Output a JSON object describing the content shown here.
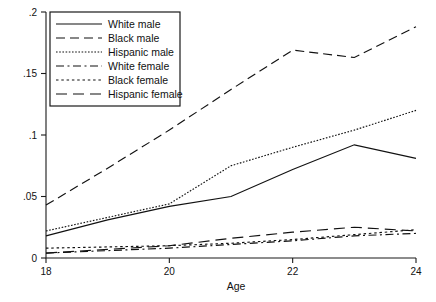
{
  "chart_data": {
    "type": "line",
    "title": "",
    "xlabel": "Age",
    "ylabel": "",
    "xlim": [
      18,
      24
    ],
    "ylim": [
      0,
      0.2
    ],
    "grid": false,
    "legend_position": "top-left",
    "xticks": [
      "18",
      "20",
      "22",
      "24"
    ],
    "xtick_values": [
      18,
      20,
      22,
      24
    ],
    "yticks": [
      "0",
      ".05",
      ".1",
      ".15",
      ".2"
    ],
    "ytick_values": [
      0,
      0.05,
      0.1,
      0.15,
      0.2
    ],
    "x": [
      18,
      19,
      20,
      21,
      22,
      23,
      24
    ],
    "series": [
      {
        "name": "White male",
        "dash": "none",
        "values": [
          0.018,
          0.031,
          0.042,
          0.05,
          0.072,
          0.092,
          0.081
        ]
      },
      {
        "name": "Black male",
        "dash": "long",
        "values": [
          0.043,
          0.073,
          0.104,
          0.137,
          0.169,
          0.163,
          0.188
        ]
      },
      {
        "name": "Hispanic male",
        "dash": "fine-dot",
        "values": [
          0.022,
          0.033,
          0.044,
          0.075,
          0.09,
          0.104,
          0.12
        ]
      },
      {
        "name": "White female",
        "dash": "dash-dot",
        "values": [
          0.004,
          0.006,
          0.008,
          0.011,
          0.014,
          0.018,
          0.02
        ]
      },
      {
        "name": "Black female",
        "dash": "dot",
        "values": [
          0.008,
          0.009,
          0.01,
          0.012,
          0.015,
          0.019,
          0.023
        ]
      },
      {
        "name": "Hispanic female",
        "dash": "med-dash",
        "values": [
          0.004,
          0.007,
          0.01,
          0.016,
          0.021,
          0.025,
          0.022
        ]
      }
    ]
  }
}
